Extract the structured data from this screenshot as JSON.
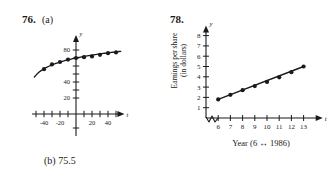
{
  "problem_76": {
    "number": "76.",
    "part_a_label": "(a)",
    "part_b_answer": "(b) 75.5",
    "chart_data": {
      "type": "scatter",
      "title": "",
      "xlabel": "t",
      "ylabel": "y",
      "xlim": [
        -55,
        58
      ],
      "ylim": [
        0,
        95
      ],
      "grid": false,
      "legend": null,
      "x_tick_labels": [
        "-40",
        "-20",
        "20",
        "40"
      ],
      "x_ticks": [
        -40,
        -20,
        20,
        40
      ],
      "x_minor_ticks": [
        -50,
        -40,
        -30,
        -20,
        -10,
        10,
        20,
        30,
        40,
        50
      ],
      "y_tick_labels": [
        "20",
        "40",
        "80"
      ],
      "y_ticks": [
        20,
        40,
        80
      ],
      "y_minor_ticks": [
        20,
        30,
        40,
        50,
        60,
        70,
        80
      ],
      "points_x": [
        -40,
        -30,
        -20,
        -10,
        0,
        10,
        20,
        30,
        40,
        50
      ],
      "points_y": [
        56,
        62,
        65,
        68,
        70,
        71,
        72,
        74,
        76,
        77
      ],
      "fit_curve_note": "logarithmic best-fit curve through the plotted data"
    }
  },
  "problem_78": {
    "number": "78.",
    "y_axis_label_line1": "Earnings per share",
    "y_axis_label_line2": "(in dollars)",
    "x_axis_caption": "Year (6 ↔ 1986)",
    "chart_data": {
      "type": "scatter",
      "title": "",
      "xlabel": "t",
      "ylabel": "y",
      "xlim": [
        5,
        14.4
      ],
      "ylim": [
        0,
        8.7
      ],
      "grid": false,
      "legend": null,
      "axis_break": true,
      "x_tick_labels": [
        "6",
        "7",
        "8",
        "9",
        "10",
        "11",
        "12",
        "13"
      ],
      "x_ticks": [
        6,
        7,
        8,
        9,
        10,
        11,
        12,
        13
      ],
      "y_tick_labels": [
        "1",
        "2",
        "3",
        "4",
        "5",
        "6",
        "7",
        "8"
      ],
      "y_ticks": [
        1,
        2,
        3,
        4,
        5,
        6,
        7,
        8
      ],
      "points_x": [
        6,
        7,
        8,
        9,
        10,
        11,
        12,
        13
      ],
      "points_y": [
        1.8,
        2.25,
        2.7,
        3.1,
        3.5,
        3.95,
        4.45,
        5.0
      ],
      "fit_line_note": "linear best-fit line through the plotted data"
    }
  },
  "style": {
    "ink": "#1a1a1a",
    "background": "#ffffff"
  }
}
